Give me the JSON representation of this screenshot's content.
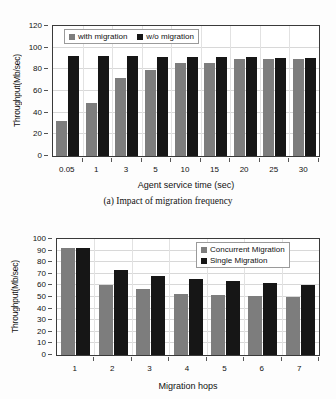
{
  "chart_data": [
    {
      "type": "bar",
      "id": "a",
      "title": "",
      "caption": "(a) Impact of migration frequency",
      "xlabel": "Agent service time (sec)",
      "ylabel": "Throughput(Mb/sec)",
      "categories": [
        "0.05",
        "1",
        "3",
        "5",
        "10",
        "15",
        "20",
        "25",
        "30"
      ],
      "series": [
        {
          "name": "with migration",
          "color": "#7d7d7d",
          "values": [
            32,
            48.5,
            72,
            79,
            85.5,
            86,
            89.5,
            89.5,
            89.5
          ]
        },
        {
          "name": "w/o migration",
          "color": "#161616",
          "values": [
            92,
            92,
            92,
            91.5,
            91.5,
            91,
            91,
            90.5,
            90.5
          ]
        }
      ],
      "ylim": [
        0,
        120
      ],
      "yticks": [
        0,
        20,
        40,
        60,
        80,
        100,
        120
      ],
      "grid": true,
      "legend_position": "top-left-inside"
    },
    {
      "type": "bar",
      "id": "b",
      "title": "",
      "caption": "",
      "xlabel": "Migration hops",
      "ylabel": "Throughput(Mb/sec)",
      "categories": [
        "1",
        "2",
        "3",
        "4",
        "5",
        "6",
        "7"
      ],
      "series": [
        {
          "name": "Concurrent Migration",
          "color": "#7d7d7d",
          "values": [
            92,
            60,
            56.5,
            53,
            51.5,
            51,
            50
          ]
        },
        {
          "name": "Single Migration",
          "color": "#161616",
          "values": [
            92,
            73,
            68,
            65.5,
            64,
            62.5,
            60.5
          ]
        }
      ],
      "ylim": [
        0,
        100
      ],
      "yticks": [
        0,
        10,
        20,
        30,
        40,
        50,
        60,
        70,
        80,
        90,
        100
      ],
      "grid": true,
      "legend_position": "top-right-inside"
    }
  ]
}
